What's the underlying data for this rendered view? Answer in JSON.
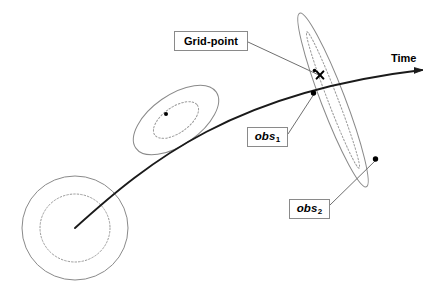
{
  "figure": {
    "type": "diagram",
    "title_visible": false,
    "background_color": "#ffffff",
    "width": 437,
    "height": 301
  },
  "labels": {
    "grid_point": "Grid-point",
    "obs1_base": "obs",
    "obs1_sub": "1",
    "obs2_base": "obs",
    "obs2_sub": "2",
    "time_axis": "Time"
  },
  "colors": {
    "trajectory": "#1a1a1a",
    "ellipse_outline": "#8a8a8a",
    "ellipse_inner_dotted": "#9a9a9a",
    "leader_line": "#6f6f6f",
    "label_border": "#8a8a8a",
    "marker": "#000000",
    "text": "#000000"
  },
  "elements": {
    "error_ellipses": [
      {
        "name": "initial-uncertainty-circle",
        "cx": 75,
        "cy": 228,
        "rx": 53,
        "ry": 52,
        "rotation": 0,
        "inner_rx": 35,
        "inner_ry": 34,
        "style": "solid-outer-dotted-inner"
      },
      {
        "name": "mid-uncertainty-ellipse",
        "cx": 176,
        "cy": 120,
        "rx": 49,
        "ry": 25,
        "rotation": -35,
        "inner_rx": 26,
        "inner_ry": 13,
        "style": "solid-outer-dotted-inner"
      },
      {
        "name": "analysis-uncertainty-ellipse",
        "cx": 333,
        "cy": 100,
        "rx": 93,
        "ry": 12,
        "rotation": 69,
        "inner_rx": 73,
        "inner_ry": 5,
        "style": "solid-outer-dotted-inner"
      }
    ],
    "trajectory": {
      "name": "state-trajectory",
      "start": [
        75,
        228
      ],
      "control_1": [
        150,
        160
      ],
      "control_2": [
        250,
        85
      ],
      "end": [
        422,
        70
      ],
      "arrow_at_end": true
    },
    "markers": [
      {
        "name": "mid-state-point",
        "x": 166,
        "y": 114,
        "r": 2.0,
        "shape": "dot"
      },
      {
        "name": "grid-point-marker",
        "x": 320,
        "y": 75,
        "r": 3.2,
        "shape": "x-cross"
      },
      {
        "name": "obs1-point",
        "x": 313,
        "y": 93,
        "r": 2.6,
        "shape": "dot"
      },
      {
        "name": "obs1-point-upper",
        "x": 315,
        "y": 71,
        "r": 1.8,
        "shape": "dot"
      },
      {
        "name": "obs2-point",
        "x": 375,
        "y": 159,
        "r": 2.6,
        "shape": "dot"
      },
      {
        "name": "time-axis-arrow-tip",
        "x": 422,
        "y": 70,
        "r": 2.0,
        "shape": "dot"
      }
    ],
    "leader_lines": [
      {
        "name": "grid-point-leader",
        "from": [
          248,
          42
        ],
        "to": [
          321,
          76
        ]
      },
      {
        "name": "obs1-leader",
        "from": [
          288,
          134
        ],
        "to": [
          314,
          94
        ]
      },
      {
        "name": "obs2-leader",
        "from": [
          330,
          205
        ],
        "to": [
          376,
          160
        ]
      }
    ]
  }
}
